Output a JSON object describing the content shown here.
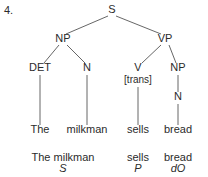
{
  "figure": {
    "item_number": "4.",
    "type": "syntax-tree",
    "width": 208,
    "height": 177,
    "line_color": "#555555",
    "text_color": "#2b2b2b",
    "background": "#ffffff"
  },
  "nodes": {
    "s": {
      "label": "S",
      "x": 112,
      "y": 13
    },
    "np_subj": {
      "label": "NP",
      "x": 63,
      "y": 42
    },
    "vp": {
      "label": "VP",
      "x": 165,
      "y": 42
    },
    "det": {
      "label": "DET",
      "x": 40,
      "y": 71
    },
    "n_subj": {
      "label": "N",
      "x": 87,
      "y": 71
    },
    "v": {
      "label": "V",
      "x": 138,
      "y": 71
    },
    "v_feat": {
      "label": "[trans]",
      "x": 138,
      "y": 83
    },
    "np_obj": {
      "label": "NP",
      "x": 178,
      "y": 71
    },
    "n_obj": {
      "label": "N",
      "x": 178,
      "y": 100
    }
  },
  "leaves": [
    {
      "word": "The",
      "x": 40,
      "y": 133
    },
    {
      "word": "milkman",
      "x": 87,
      "y": 133
    },
    {
      "word": "sells",
      "x": 138,
      "y": 133
    },
    {
      "word": "bread",
      "x": 178,
      "y": 133
    }
  ],
  "branches": [
    {
      "from": "s",
      "to": "np_subj",
      "x1": 108,
      "y1": 16,
      "x2": 66,
      "y2": 34
    },
    {
      "from": "s",
      "to": "vp",
      "x1": 116,
      "y1": 16,
      "x2": 161,
      "y2": 34
    },
    {
      "from": "np_subj",
      "to": "det",
      "x1": 59,
      "y1": 45,
      "x2": 44,
      "y2": 63
    },
    {
      "from": "np_subj",
      "to": "n_subj",
      "x1": 67,
      "y1": 45,
      "x2": 85,
      "y2": 63
    },
    {
      "from": "vp",
      "to": "v",
      "x1": 161,
      "y1": 45,
      "x2": 142,
      "y2": 63
    },
    {
      "from": "vp",
      "to": "np_obj",
      "x1": 169,
      "y1": 45,
      "x2": 176,
      "y2": 63
    },
    {
      "from": "np_obj",
      "to": "n_obj",
      "x1": 178,
      "y1": 75,
      "x2": 178,
      "y2": 92
    },
    {
      "from": "det",
      "to": "the",
      "x1": 40,
      "y1": 75,
      "x2": 40,
      "y2": 125
    },
    {
      "from": "n_subj",
      "to": "milkman",
      "x1": 87,
      "y1": 75,
      "x2": 87,
      "y2": 125
    },
    {
      "from": "v_feat",
      "to": "sells",
      "x1": 138,
      "y1": 87,
      "x2": 138,
      "y2": 125
    },
    {
      "from": "n_obj",
      "to": "bread",
      "x1": 178,
      "y1": 104,
      "x2": 178,
      "y2": 125
    }
  ],
  "glosses": [
    {
      "phrase": "The milkman",
      "role": "S",
      "x": 63,
      "y_phrase": 161,
      "y_role": 172
    },
    {
      "phrase": "sells",
      "role": "P",
      "x": 138,
      "y_phrase": 161,
      "y_role": 172
    },
    {
      "phrase": "bread",
      "role": "dO",
      "x": 178,
      "y_phrase": 161,
      "y_role": 172
    }
  ]
}
